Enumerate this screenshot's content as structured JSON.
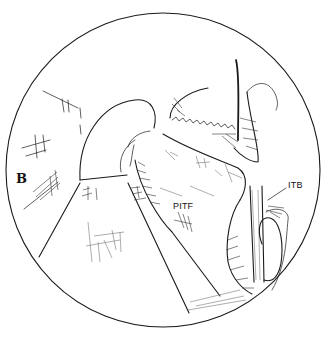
{
  "figure": {
    "type": "arthroscopic view illustration (line drawing)",
    "labels": {
      "pitf": "PITF",
      "itb": "ITB",
      "panel": "B"
    }
  },
  "colors": {
    "background": "#ffffff",
    "ink": "#1a1a1a"
  }
}
